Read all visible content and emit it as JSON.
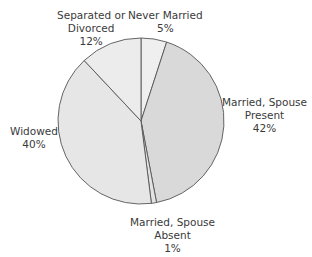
{
  "chart_data": {
    "type": "pie",
    "title": "",
    "categories": [
      "Never Married",
      "Married, Spouse Present",
      "Married, Spouse Absent",
      "Widowed",
      "Separated or Divorced"
    ],
    "values": [
      5,
      42,
      1,
      40,
      12
    ],
    "unit": "%",
    "start_angle_deg": 0,
    "direction": "clockwise",
    "colors": [
      "#efefef",
      "#d9d9d9",
      "#e3e3e3",
      "#e6e6e6",
      "#ececec"
    ],
    "labels": [
      {
        "line1": "Never Married",
        "line2": "",
        "pct": "5%"
      },
      {
        "line1": "Married, Spouse",
        "line2": "Present",
        "pct": "42%"
      },
      {
        "line1": "Married, Spouse",
        "line2": "Absent",
        "pct": "1%"
      },
      {
        "line1": "Widowed",
        "line2": "",
        "pct": "40%"
      },
      {
        "line1": "Separated or",
        "line2": "Divorced",
        "pct": "12%"
      }
    ],
    "legend": "none"
  }
}
